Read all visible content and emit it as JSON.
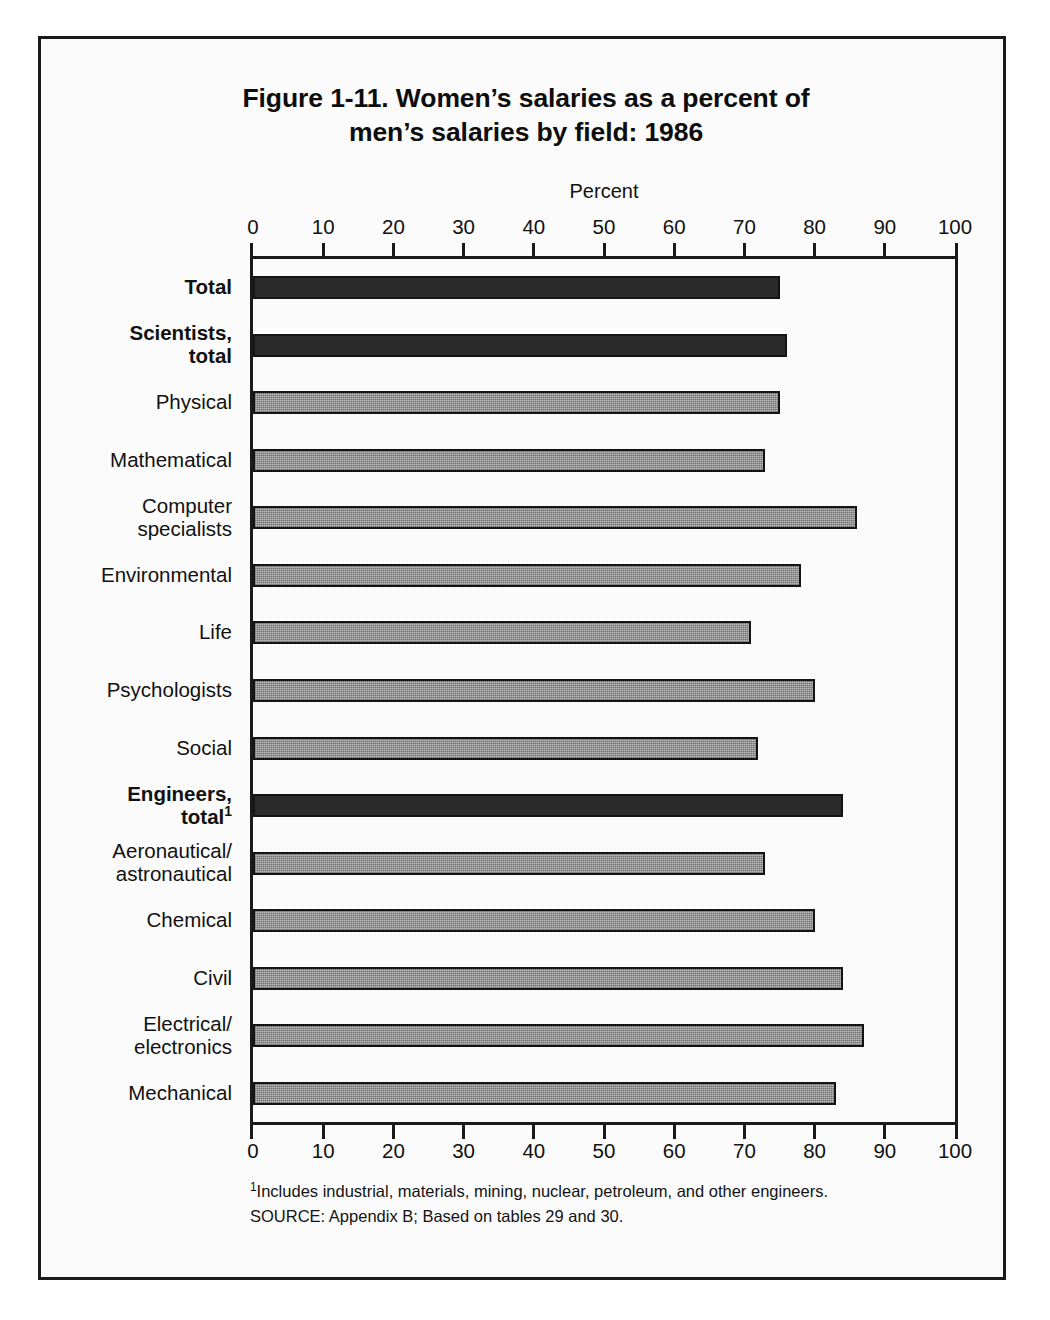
{
  "figure": {
    "title_line1": "Figure 1-11.  Women’s salaries as a percent of",
    "title_line2": "men’s salaries by field: 1986",
    "footnote_marker": "1",
    "footnote_text": "Includes industrial, materials, mining, nuclear, petroleum, and other engineers.",
    "source_text": "SOURCE:  Appendix B; Based on tables 29 and 30."
  },
  "chart_data": {
    "type": "bar",
    "orientation": "horizontal",
    "title": "Figure 1-11.  Women’s salaries as a percent of men’s salaries by field: 1986",
    "xlabel": "Percent",
    "ylabel": "",
    "xlim": [
      0,
      100
    ],
    "xticks": [
      0,
      10,
      20,
      30,
      40,
      50,
      60,
      70,
      80,
      90,
      100
    ],
    "xtick_labels": [
      "0",
      "10",
      "20",
      "30",
      "40",
      "50",
      "60",
      "70",
      "80",
      "90",
      "100"
    ],
    "grid": false,
    "legend": "none",
    "axis_top_duplicate": true,
    "categories": [
      "Total",
      "Scientists, total",
      "Physical",
      "Mathematical",
      "Computer specialists",
      "Environmental",
      "Life",
      "Psychologists",
      "Social",
      "Engineers, total¹",
      "Aeronautical/ astronautical",
      "Chemical",
      "Civil",
      "Electrical/ electronics",
      "Mechanical"
    ],
    "values": [
      75,
      76,
      75,
      73,
      86,
      78,
      71,
      80,
      72,
      84,
      73,
      80,
      84,
      87,
      83
    ],
    "bars": [
      {
        "label_lines": [
          "Total"
        ],
        "value": 75,
        "style": "dark",
        "bold": true,
        "superscript": ""
      },
      {
        "label_lines": [
          "Scientists,",
          "total"
        ],
        "value": 76,
        "style": "dark",
        "bold": true,
        "superscript": ""
      },
      {
        "label_lines": [
          "Physical"
        ],
        "value": 75,
        "style": "grey",
        "bold": false,
        "superscript": ""
      },
      {
        "label_lines": [
          "Mathematical"
        ],
        "value": 73,
        "style": "grey",
        "bold": false,
        "superscript": ""
      },
      {
        "label_lines": [
          "Computer",
          "specialists"
        ],
        "value": 86,
        "style": "grey",
        "bold": false,
        "superscript": ""
      },
      {
        "label_lines": [
          "Environmental"
        ],
        "value": 78,
        "style": "grey",
        "bold": false,
        "superscript": ""
      },
      {
        "label_lines": [
          "Life"
        ],
        "value": 71,
        "style": "grey",
        "bold": false,
        "superscript": ""
      },
      {
        "label_lines": [
          "Psychologists"
        ],
        "value": 80,
        "style": "grey",
        "bold": false,
        "superscript": ""
      },
      {
        "label_lines": [
          "Social"
        ],
        "value": 72,
        "style": "grey",
        "bold": false,
        "superscript": ""
      },
      {
        "label_lines": [
          "Engineers,",
          "total"
        ],
        "value": 84,
        "style": "dark",
        "bold": true,
        "superscript": "1"
      },
      {
        "label_lines": [
          "Aeronautical/",
          "astronautical"
        ],
        "value": 73,
        "style": "grey",
        "bold": false,
        "superscript": ""
      },
      {
        "label_lines": [
          "Chemical"
        ],
        "value": 80,
        "style": "grey",
        "bold": false,
        "superscript": ""
      },
      {
        "label_lines": [
          "Civil"
        ],
        "value": 84,
        "style": "grey",
        "bold": false,
        "superscript": ""
      },
      {
        "label_lines": [
          "Electrical/",
          "electronics"
        ],
        "value": 87,
        "style": "grey",
        "bold": false,
        "superscript": ""
      },
      {
        "label_lines": [
          "Mechanical"
        ],
        "value": 83,
        "style": "grey",
        "bold": false,
        "superscript": ""
      }
    ],
    "colors": {
      "bar_dark": "#2b2b2b",
      "bar_grey": "#9c9c9c",
      "outline": "#141414",
      "background": "#fbfbfb",
      "text": "#111111"
    }
  }
}
